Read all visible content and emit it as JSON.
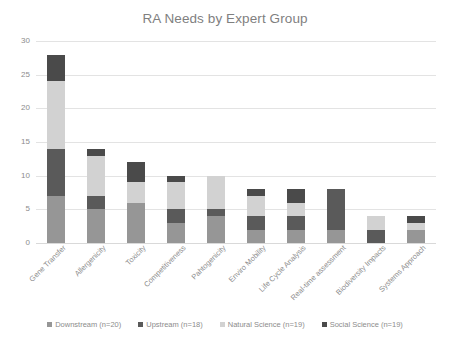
{
  "chart_data": {
    "type": "bar",
    "subtype": "stacked-bar-vertical",
    "title": "RA Needs by Expert Group",
    "xlabel": "",
    "ylabel": "",
    "ylim": [
      0,
      30
    ],
    "yticks": [
      0,
      5,
      10,
      15,
      20,
      25,
      30
    ],
    "ytick_labels": [
      "0",
      "5",
      "10",
      "15",
      "20",
      "25",
      "30"
    ],
    "grid": true,
    "grid_axis": "y",
    "legend_position": "bottom",
    "categories": [
      "Gene Transfer",
      "Allergenicity",
      "Toxicity",
      "Competitiveness",
      "Pahtogenicity",
      "Enviro Mobility",
      "Life Cycle Analysis",
      "Real-time assessment",
      "Biodiversity Impacts",
      "Systems Approach"
    ],
    "series": [
      {
        "name": "Downstream (n=20)",
        "color": "#969696",
        "values": [
          7,
          5,
          6,
          3,
          4,
          2,
          2,
          2,
          0,
          2
        ]
      },
      {
        "name": "Upstream (n=18)",
        "color": "#5a5a5a",
        "values": [
          7,
          2,
          0,
          2,
          1,
          2,
          2,
          6,
          2,
          0
        ]
      },
      {
        "name": "Natural Science (n=19)",
        "color": "#d2d2d2",
        "values": [
          10,
          6,
          3,
          4,
          5,
          3,
          2,
          0,
          2,
          1
        ]
      },
      {
        "name": "Social Science (n=19)",
        "color": "#4a4a4a",
        "values": [
          4,
          1,
          3,
          1,
          0,
          1,
          2,
          0,
          0,
          1
        ]
      }
    ],
    "totals": [
      28,
      14,
      12,
      10,
      10,
      8,
      8,
      8,
      4,
      4
    ]
  },
  "caption": {
    "text": ""
  }
}
